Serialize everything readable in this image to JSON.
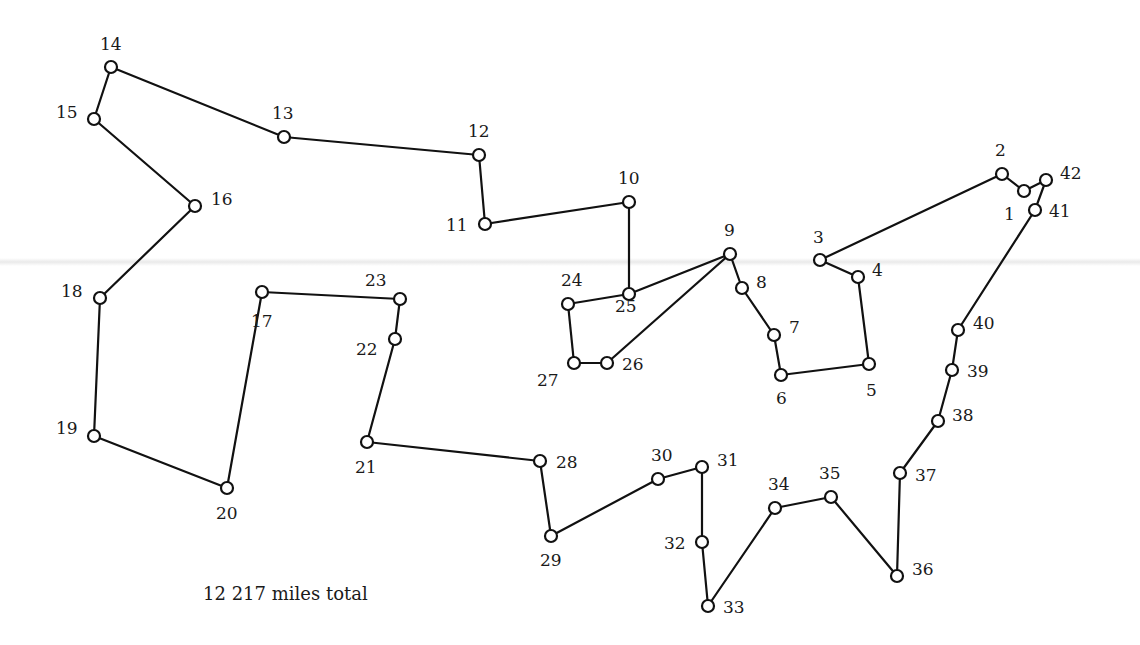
{
  "caption": "12 217 miles total",
  "chart_data": {
    "type": "diagram",
    "total_label": "12 217 miles total",
    "tour_order": [
      1,
      2,
      3,
      4,
      5,
      6,
      7,
      8,
      9,
      25,
      10,
      11,
      12,
      13,
      14,
      15,
      16,
      18,
      19,
      20,
      17,
      23,
      22,
      21,
      28,
      29,
      30,
      31,
      32,
      33,
      34,
      35,
      36,
      37,
      38,
      39,
      40,
      41,
      42,
      1
    ],
    "extra_edges": [
      [
        24,
        25
      ],
      [
        24,
        27
      ],
      [
        27,
        26
      ],
      [
        26,
        9
      ]
    ],
    "nodes": [
      {
        "id": 1,
        "x": 1024,
        "y": 191,
        "lx": 1004,
        "ly": 220
      },
      {
        "id": 2,
        "x": 1002,
        "y": 174,
        "lx": 995,
        "ly": 156
      },
      {
        "id": 3,
        "x": 820,
        "y": 260,
        "lx": 813,
        "ly": 243
      },
      {
        "id": 4,
        "x": 858,
        "y": 277,
        "lx": 872,
        "ly": 276
      },
      {
        "id": 5,
        "x": 869,
        "y": 364,
        "lx": 866,
        "ly": 396
      },
      {
        "id": 6,
        "x": 781,
        "y": 375,
        "lx": 776,
        "ly": 404
      },
      {
        "id": 7,
        "x": 774,
        "y": 335,
        "lx": 789,
        "ly": 333
      },
      {
        "id": 8,
        "x": 742,
        "y": 288,
        "lx": 756,
        "ly": 288
      },
      {
        "id": 9,
        "x": 730,
        "y": 254,
        "lx": 724,
        "ly": 236
      },
      {
        "id": 10,
        "x": 629,
        "y": 202,
        "lx": 618,
        "ly": 184
      },
      {
        "id": 11,
        "x": 485,
        "y": 224,
        "lx": 446,
        "ly": 231
      },
      {
        "id": 12,
        "x": 479,
        "y": 155,
        "lx": 468,
        "ly": 137
      },
      {
        "id": 13,
        "x": 284,
        "y": 137,
        "lx": 272,
        "ly": 119
      },
      {
        "id": 14,
        "x": 111,
        "y": 67,
        "lx": 100,
        "ly": 50
      },
      {
        "id": 15,
        "x": 94,
        "y": 119,
        "lx": 56,
        "ly": 118
      },
      {
        "id": 16,
        "x": 195,
        "y": 206,
        "lx": 211,
        "ly": 205
      },
      {
        "id": 17,
        "x": 262,
        "y": 292,
        "lx": 251,
        "ly": 327
      },
      {
        "id": 18,
        "x": 100,
        "y": 298,
        "lx": 61,
        "ly": 297
      },
      {
        "id": 19,
        "x": 94,
        "y": 436,
        "lx": 56,
        "ly": 434
      },
      {
        "id": 20,
        "x": 227,
        "y": 488,
        "lx": 216,
        "ly": 519
      },
      {
        "id": 21,
        "x": 367,
        "y": 442,
        "lx": 355,
        "ly": 473
      },
      {
        "id": 22,
        "x": 395,
        "y": 339,
        "lx": 356,
        "ly": 355
      },
      {
        "id": 23,
        "x": 400,
        "y": 299,
        "lx": 365,
        "ly": 286
      },
      {
        "id": 24,
        "x": 568,
        "y": 304,
        "lx": 561,
        "ly": 286
      },
      {
        "id": 25,
        "x": 629,
        "y": 294,
        "lx": 615,
        "ly": 312
      },
      {
        "id": 26,
        "x": 607,
        "y": 363,
        "lx": 622,
        "ly": 370
      },
      {
        "id": 27,
        "x": 574,
        "y": 363,
        "lx": 537,
        "ly": 386
      },
      {
        "id": 28,
        "x": 540,
        "y": 461,
        "lx": 556,
        "ly": 468
      },
      {
        "id": 29,
        "x": 551,
        "y": 536,
        "lx": 540,
        "ly": 566
      },
      {
        "id": 30,
        "x": 658,
        "y": 479,
        "lx": 651,
        "ly": 461
      },
      {
        "id": 31,
        "x": 702,
        "y": 467,
        "lx": 717,
        "ly": 466
      },
      {
        "id": 32,
        "x": 702,
        "y": 542,
        "lx": 664,
        "ly": 549
      },
      {
        "id": 33,
        "x": 708,
        "y": 606,
        "lx": 723,
        "ly": 613
      },
      {
        "id": 34,
        "x": 775,
        "y": 508,
        "lx": 768,
        "ly": 490
      },
      {
        "id": 35,
        "x": 831,
        "y": 497,
        "lx": 819,
        "ly": 479
      },
      {
        "id": 36,
        "x": 897,
        "y": 576,
        "lx": 912,
        "ly": 575
      },
      {
        "id": 37,
        "x": 900,
        "y": 473,
        "lx": 915,
        "ly": 481
      },
      {
        "id": 38,
        "x": 938,
        "y": 421,
        "lx": 952,
        "ly": 421
      },
      {
        "id": 39,
        "x": 952,
        "y": 370,
        "lx": 967,
        "ly": 377
      },
      {
        "id": 40,
        "x": 958,
        "y": 330,
        "lx": 973,
        "ly": 329
      },
      {
        "id": 41,
        "x": 1035,
        "y": 210,
        "lx": 1049,
        "ly": 217
      },
      {
        "id": 42,
        "x": 1046,
        "y": 180,
        "lx": 1060,
        "ly": 179
      }
    ]
  }
}
